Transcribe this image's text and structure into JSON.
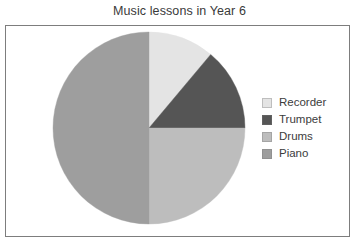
{
  "chart_data": {
    "type": "pie",
    "title": "Music lessons in Year 6",
    "xlabel": "",
    "ylabel": "",
    "legend_position": "right",
    "grid": false,
    "start_angle_deg": 0,
    "direction": "clockwise",
    "categories": [
      "Recorder",
      "Trumpet",
      "Drums",
      "Piano"
    ],
    "values": [
      11,
      14,
      25,
      50
    ],
    "units": "percent",
    "slices": [
      {
        "label": "Recorder",
        "value": 11,
        "angle_deg": 40,
        "start_deg": 0,
        "end_deg": 40,
        "color": "#e4e4e4"
      },
      {
        "label": "Trumpet",
        "value": 14,
        "angle_deg": 50,
        "start_deg": 40,
        "end_deg": 90,
        "color": "#555555"
      },
      {
        "label": "Drums",
        "value": 25,
        "angle_deg": 90,
        "start_deg": 90,
        "end_deg": 180,
        "color": "#bdbdbd"
      },
      {
        "label": "Piano",
        "value": 50,
        "angle_deg": 180,
        "start_deg": 180,
        "end_deg": 360,
        "color": "#9e9e9e"
      }
    ]
  },
  "figure": {
    "frame_color": "#7d7d7d",
    "background": "#ffffff",
    "title_color": "#3a3a3a"
  },
  "legend": {
    "items": [
      {
        "label": "Recorder",
        "color": "#e4e4e4"
      },
      {
        "label": "Trumpet",
        "color": "#555555"
      },
      {
        "label": "Drums",
        "color": "#bdbdbd"
      },
      {
        "label": "Piano",
        "color": "#9e9e9e"
      }
    ]
  }
}
